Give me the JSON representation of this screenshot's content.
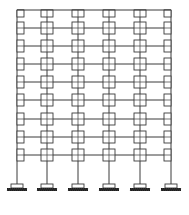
{
  "diagram": {
    "type": "structural-frame",
    "stroke_color": "#3a3a3a",
    "fill_color": "#ffffff",
    "support_color": "#1a1a1a",
    "bays": 5,
    "storeys": 9,
    "column_x": [
      17,
      47,
      78,
      109,
      140,
      171
    ],
    "floor_y": [
      10,
      28,
      46,
      64,
      82,
      100,
      119,
      137,
      155
    ],
    "base_y": 188,
    "joint_size": 12,
    "edge_joint_width": 7
  }
}
